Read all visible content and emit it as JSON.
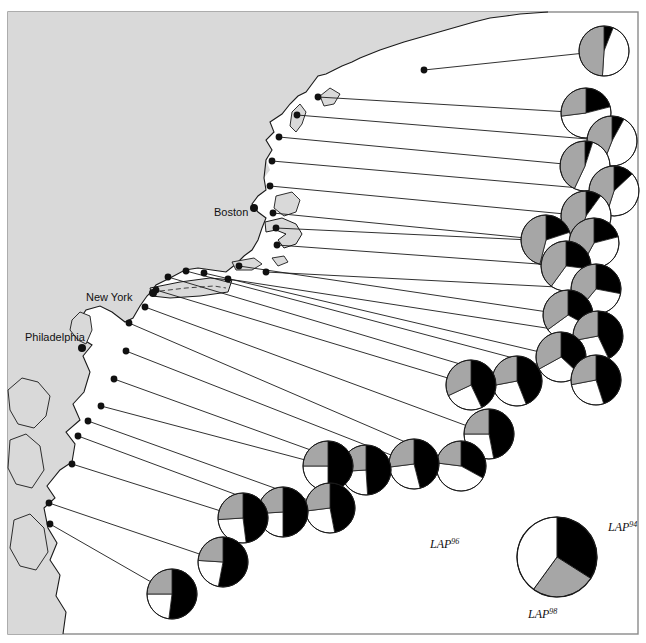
{
  "figure": {
    "title": "",
    "background_color": "#ffffff",
    "land_color": "#d9d9d9",
    "ocean_color": "#ffffff",
    "border_color": "#8a8a8a",
    "line_color": "#1a1a1a"
  },
  "cities": [
    {
      "name": "Boston",
      "label_x": 214,
      "label_y": 212,
      "dot_x": 254,
      "dot_y": 208
    },
    {
      "name": "New York",
      "label_x": 86,
      "label_y": 297,
      "dot_x": 153,
      "dot_y": 293
    },
    {
      "name": "Philadelphia",
      "label_x": 25,
      "label_y": 337,
      "dot_x": 82,
      "dot_y": 348
    }
  ],
  "legend": {
    "pie": {
      "cx": 557,
      "cy": 557,
      "r": 40
    },
    "allele_94": {
      "base": "LAP",
      "sup": "94",
      "color": "#000000",
      "x": 608,
      "y": 531,
      "fraction": 0.34
    },
    "allele_96": {
      "base": "LAP",
      "sup": "96",
      "color": "#ffffff",
      "x": 430,
      "y": 548,
      "fraction": 0.4
    },
    "allele_98": {
      "base": "LAP",
      "sup": "98",
      "color": "#a6a6a6",
      "x": 528,
      "y": 618,
      "fraction": 0.26
    }
  },
  "chart_data": {
    "type": "pie",
    "legend_position": "bottom-right",
    "series_names": [
      "LAP94",
      "LAP96",
      "LAP98"
    ],
    "series_colors": [
      "#000000",
      "#ffffff",
      "#a6a6a6"
    ],
    "sites": [
      {
        "id": 1,
        "site_x": 424,
        "site_y": 70,
        "pie_x": 604,
        "pie_y": 51,
        "r": 25,
        "values": [
          0.06,
          0.45,
          0.49
        ]
      },
      {
        "id": 2,
        "site_x": 318,
        "site_y": 97,
        "pie_x": 586,
        "pie_y": 113,
        "r": 25,
        "values": [
          0.21,
          0.52,
          0.27
        ]
      },
      {
        "id": 3,
        "site_x": 297,
        "site_y": 115,
        "pie_x": 612,
        "pie_y": 141,
        "r": 25,
        "values": [
          0.08,
          0.48,
          0.44
        ]
      },
      {
        "id": 4,
        "site_x": 279,
        "site_y": 137,
        "pie_x": 585,
        "pie_y": 166,
        "r": 25,
        "values": [
          0.05,
          0.52,
          0.43
        ]
      },
      {
        "id": 5,
        "site_x": 272,
        "site_y": 161,
        "pie_x": 614,
        "pie_y": 191,
        "r": 25,
        "values": [
          0.13,
          0.42,
          0.45
        ]
      },
      {
        "id": 6,
        "site_x": 270,
        "site_y": 186,
        "pie_x": 586,
        "pie_y": 216,
        "r": 25,
        "values": [
          0.1,
          0.45,
          0.45
        ]
      },
      {
        "id": 7,
        "site_x": 273,
        "site_y": 213,
        "pie_x": 546,
        "pie_y": 240,
        "r": 25,
        "values": [
          0.2,
          0.34,
          0.46
        ]
      },
      {
        "id": 8,
        "site_x": 276,
        "site_y": 228,
        "pie_x": 594,
        "pie_y": 243,
        "r": 25,
        "values": [
          0.21,
          0.37,
          0.42
        ]
      },
      {
        "id": 9,
        "site_x": 277,
        "site_y": 245,
        "pie_x": 566,
        "pie_y": 266,
        "r": 25,
        "values": [
          0.27,
          0.33,
          0.4
        ]
      },
      {
        "id": 10,
        "site_x": 266,
        "site_y": 272,
        "pie_x": 596,
        "pie_y": 289,
        "r": 25,
        "values": [
          0.28,
          0.33,
          0.39
        ]
      },
      {
        "id": 11,
        "site_x": 239,
        "site_y": 266,
        "pie_x": 568,
        "pie_y": 315,
        "r": 25,
        "values": [
          0.33,
          0.32,
          0.35
        ]
      },
      {
        "id": 12,
        "site_x": 228,
        "site_y": 279,
        "pie_x": 598,
        "pie_y": 336,
        "r": 25,
        "values": [
          0.43,
          0.29,
          0.28
        ]
      },
      {
        "id": 13,
        "site_x": 204,
        "site_y": 273,
        "pie_x": 561,
        "pie_y": 357,
        "r": 25,
        "values": [
          0.37,
          0.3,
          0.33
        ]
      },
      {
        "id": 14,
        "site_x": 186,
        "site_y": 271,
        "pie_x": 596,
        "pie_y": 380,
        "r": 25,
        "values": [
          0.45,
          0.27,
          0.28
        ]
      },
      {
        "id": 15,
        "site_x": 168,
        "site_y": 277,
        "pie_x": 517,
        "pie_y": 381,
        "r": 25,
        "values": [
          0.44,
          0.28,
          0.28
        ]
      },
      {
        "id": 16,
        "site_x": 156,
        "site_y": 290,
        "pie_x": 471,
        "pie_y": 385,
        "r": 25,
        "values": [
          0.43,
          0.25,
          0.32
        ]
      },
      {
        "id": 17,
        "site_x": 145,
        "site_y": 307,
        "pie_x": 489,
        "pie_y": 434,
        "r": 25,
        "values": [
          0.47,
          0.28,
          0.25
        ]
      },
      {
        "id": 18,
        "site_x": 129,
        "site_y": 323,
        "pie_x": 461,
        "pie_y": 466,
        "r": 25,
        "values": [
          0.33,
          0.44,
          0.23
        ]
      },
      {
        "id": 19,
        "site_x": 126,
        "site_y": 351,
        "pie_x": 414,
        "pie_y": 464,
        "r": 25,
        "values": [
          0.46,
          0.27,
          0.27
        ]
      },
      {
        "id": 20,
        "site_x": 114,
        "site_y": 379,
        "pie_x": 366,
        "pie_y": 470,
        "r": 25,
        "values": [
          0.49,
          0.25,
          0.26
        ]
      },
      {
        "id": 21,
        "site_x": 101,
        "site_y": 406,
        "pie_x": 328,
        "pie_y": 466,
        "r": 25,
        "values": [
          0.5,
          0.25,
          0.25
        ]
      },
      {
        "id": 22,
        "site_x": 88,
        "site_y": 421,
        "pie_x": 330,
        "pie_y": 508,
        "r": 25,
        "values": [
          0.47,
          0.26,
          0.27
        ]
      },
      {
        "id": 23,
        "site_x": 78,
        "site_y": 436,
        "pie_x": 283,
        "pie_y": 512,
        "r": 25,
        "values": [
          0.5,
          0.24,
          0.26
        ]
      },
      {
        "id": 24,
        "site_x": 72,
        "site_y": 464,
        "pie_x": 243,
        "pie_y": 518,
        "r": 25,
        "values": [
          0.48,
          0.26,
          0.26
        ]
      },
      {
        "id": 25,
        "site_x": 49,
        "site_y": 503,
        "pie_x": 223,
        "pie_y": 562,
        "r": 25,
        "values": [
          0.53,
          0.23,
          0.24
        ]
      },
      {
        "id": 26,
        "site_x": 50,
        "site_y": 524,
        "pie_x": 172,
        "pie_y": 594,
        "r": 25,
        "values": [
          0.52,
          0.23,
          0.25
        ]
      }
    ]
  }
}
